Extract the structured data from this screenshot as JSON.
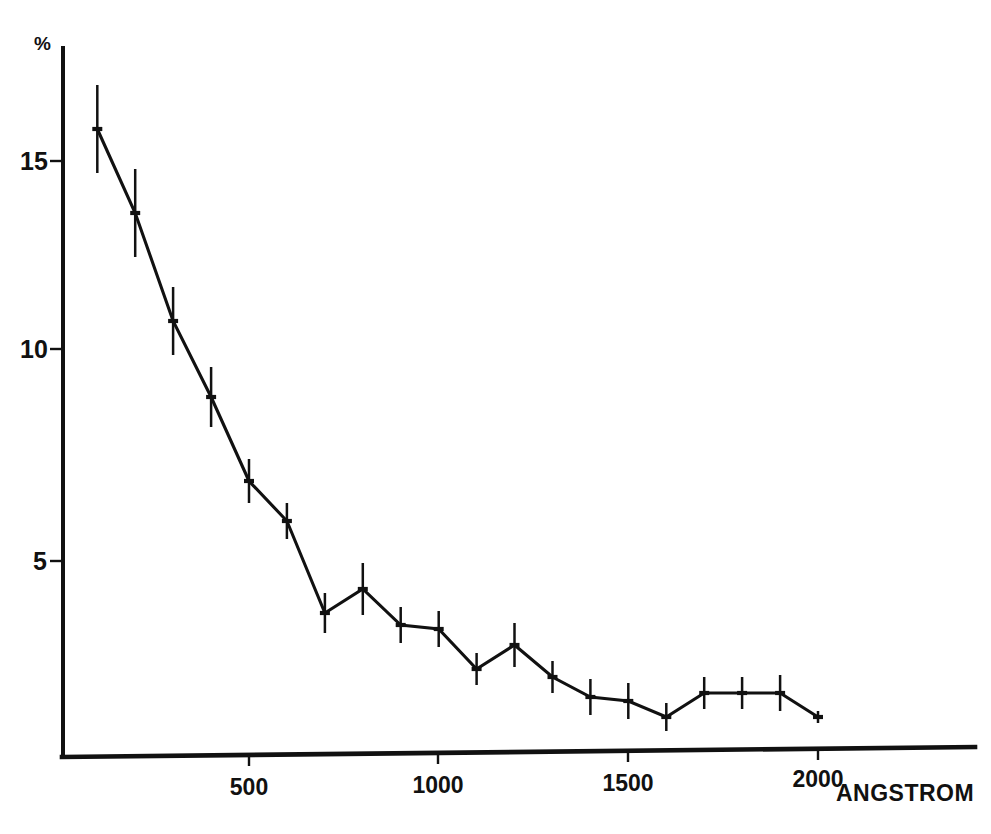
{
  "chart_data": {
    "type": "line",
    "title": "",
    "subtitle": "",
    "xlabel": "ANGSTROM",
    "ylabel": "%",
    "xlim": [
      0,
      2100
    ],
    "ylim": [
      0,
      17.2
    ],
    "grid": false,
    "legend": "none",
    "x_ticks": [
      500,
      1000,
      1500,
      2000
    ],
    "x_tick_labels": [
      "500",
      "1000",
      "1500",
      "2000"
    ],
    "y_ticks": [
      5,
      10,
      15
    ],
    "y_tick_labels": [
      "5",
      "10",
      "15"
    ],
    "x": [
      100,
      200,
      300,
      400,
      500,
      600,
      700,
      800,
      900,
      1000,
      1100,
      1200,
      1300,
      1400,
      1500,
      1600,
      1700,
      1800,
      1900,
      2000
    ],
    "series": [
      {
        "name": "percentage",
        "values": [
          15.8,
          13.7,
          11.0,
          9.1,
          7.0,
          6.0,
          3.7,
          4.3,
          3.4,
          3.3,
          2.3,
          2.9,
          2.1,
          1.6,
          1.5,
          1.1,
          1.7,
          1.7,
          1.7,
          1.1
        ],
        "errors": [
          1.1,
          1.1,
          0.85,
          0.75,
          0.55,
          0.45,
          0.5,
          0.65,
          0.45,
          0.45,
          0.4,
          0.55,
          0.4,
          0.45,
          0.45,
          0.35,
          0.4,
          0.4,
          0.45,
          0.15
        ]
      }
    ]
  },
  "axes": {
    "y_unit_label": "%",
    "x_axis_title": "ANGSTROM"
  },
  "colors": {
    "ink": "#111111",
    "background": "#ffffff"
  }
}
